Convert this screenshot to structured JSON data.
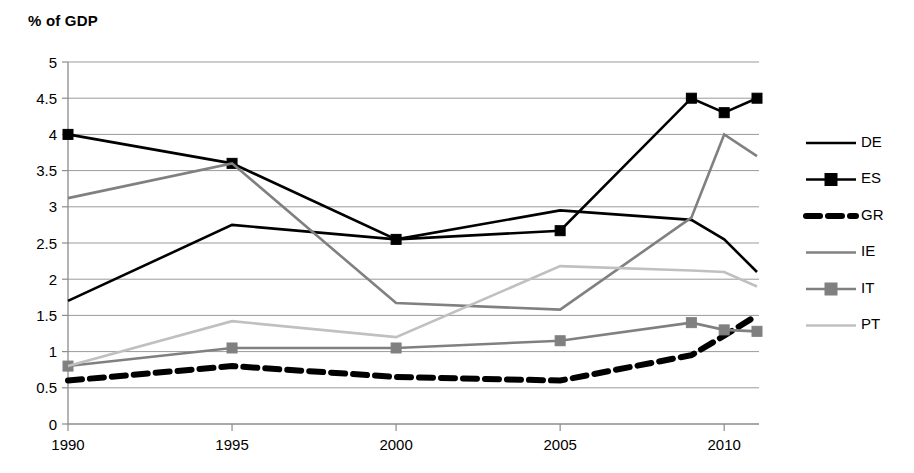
{
  "chart_data": {
    "type": "line",
    "title": "% of GDP",
    "xlabel": "",
    "ylabel": "% of GDP",
    "x": [
      1990,
      1995,
      2000,
      2005,
      2009,
      2010,
      2011
    ],
    "xtick_labels": [
      "1990",
      "1995",
      "2000",
      "2005",
      "2010"
    ],
    "xticks": [
      1990,
      1995,
      2000,
      2005,
      2010
    ],
    "xlim": [
      1990,
      2011
    ],
    "ylim": [
      0,
      5
    ],
    "yticks": [
      0,
      0.5,
      1,
      1.5,
      2,
      2.5,
      3,
      3.5,
      4,
      4.5,
      5
    ],
    "ytick_labels": [
      "0",
      "0.5",
      "1",
      "1.5",
      "2",
      "2.5",
      "3",
      "3.5",
      "4",
      "4.5",
      "5"
    ],
    "grid": true,
    "legend_position": "right",
    "series": [
      {
        "name": "DE",
        "color": "#000000",
        "style": "solid",
        "marker": "none",
        "width": 2.6,
        "values": [
          1.7,
          2.75,
          2.55,
          2.95,
          2.82,
          2.55,
          2.1
        ]
      },
      {
        "name": "ES",
        "color": "#000000",
        "style": "solid",
        "marker": "square",
        "width": 2.6,
        "values": [
          4.0,
          3.6,
          2.55,
          2.67,
          4.5,
          4.3,
          4.5
        ]
      },
      {
        "name": "GR",
        "color": "#000000",
        "style": "dashed",
        "marker": "none",
        "width": 6.0,
        "values": [
          0.6,
          0.8,
          0.65,
          0.6,
          0.95,
          1.22,
          1.5
        ]
      },
      {
        "name": "IE",
        "color": "#808080",
        "style": "solid",
        "marker": "none",
        "width": 2.6,
        "values": [
          3.12,
          3.6,
          1.67,
          1.58,
          2.85,
          4.0,
          3.7
        ]
      },
      {
        "name": "IT",
        "color": "#808080",
        "style": "solid",
        "marker": "square",
        "width": 2.6,
        "values": [
          0.8,
          1.05,
          1.05,
          1.15,
          1.4,
          1.3,
          1.28
        ]
      },
      {
        "name": "PT",
        "color": "#c0c0c0",
        "style": "solid",
        "marker": "none",
        "width": 2.6,
        "values": [
          0.8,
          1.42,
          1.2,
          2.18,
          2.12,
          2.1,
          1.9
        ]
      }
    ]
  },
  "legend": {
    "entries": [
      {
        "label": "DE"
      },
      {
        "label": "ES"
      },
      {
        "label": "GR"
      },
      {
        "label": "IE"
      },
      {
        "label": "IT"
      },
      {
        "label": "PT"
      }
    ]
  }
}
